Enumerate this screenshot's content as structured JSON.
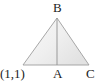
{
  "figure": {
    "type": "geometry-diagram",
    "background_color": "#ffffff",
    "stroke_color": "#9a9a9a",
    "median_color": "#8f8f8f",
    "fill_start_color": "#f7f7f7",
    "fill_end_color": "#e4e4e4",
    "labels": {
      "apex": "B",
      "base_midpoint": "A",
      "base_right": "C",
      "base_left_coordinate": "(1,1)"
    },
    "points": {
      "B": {
        "x": 57,
        "y": 18
      },
      "base_left": {
        "x": 23,
        "y": 65
      },
      "A": {
        "x": 57,
        "y": 65
      },
      "C": {
        "x": 89,
        "y": 65
      }
    }
  }
}
